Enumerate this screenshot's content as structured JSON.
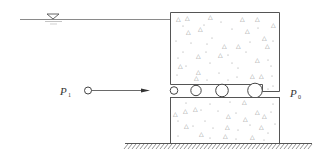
{
  "diagram": {
    "type": "engineering-schematic",
    "labels": {
      "p1_main": "P",
      "p1_sub": "1",
      "p0_main": "P",
      "p0_sub": "0"
    },
    "symbols": {
      "water_level": "water-level-triangle",
      "ground": "ground-hatching"
    },
    "rollers": [
      {
        "cx": 174,
        "cy": 90.5,
        "r": 3.8
      },
      {
        "cx": 196,
        "cy": 90.5,
        "r": 5.2
      },
      {
        "cx": 222,
        "cy": 90.5,
        "r": 6.3
      },
      {
        "cx": 255,
        "cy": 90.5,
        "r": 7.3
      }
    ],
    "colors": {
      "stroke": "#444444",
      "water_line": "#888888",
      "aggregate": "#777777"
    }
  }
}
